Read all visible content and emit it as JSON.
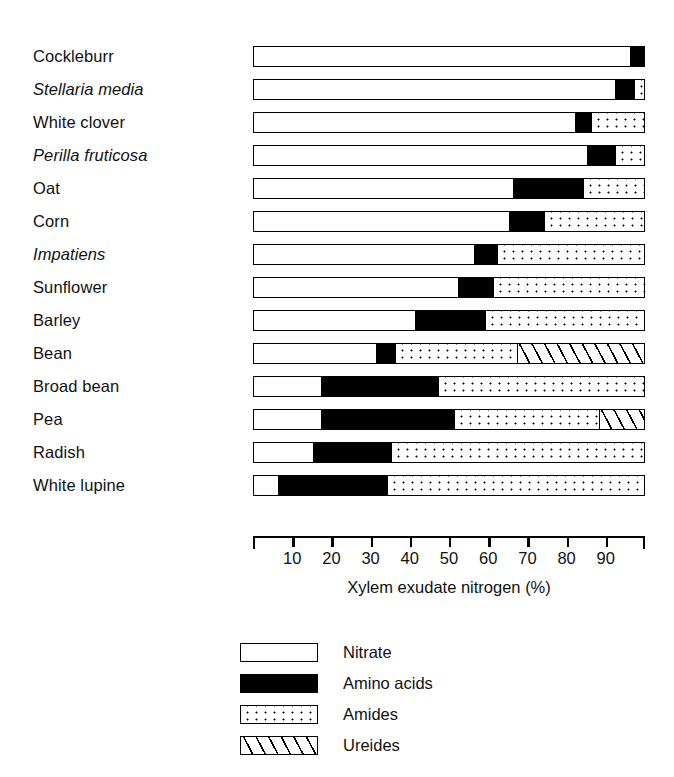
{
  "chart_data": {
    "type": "bar",
    "orientation": "horizontal",
    "stacked": true,
    "title": "",
    "xlabel": "Xylem exudate nitrogen (%)",
    "ylabel": "",
    "xlim": [
      0,
      100
    ],
    "xticks": [
      10,
      20,
      30,
      40,
      50,
      60,
      70,
      80,
      90
    ],
    "xtick_labels": [
      "10",
      "20",
      "30",
      "40",
      "50",
      "60",
      "70",
      "80",
      "90"
    ],
    "grid": false,
    "legend_position": "below-axis",
    "categories": [
      {
        "label": "Cockleburr",
        "italic": false
      },
      {
        "label": "Stellaria media",
        "italic": true
      },
      {
        "label": "White clover",
        "italic": false
      },
      {
        "label": "Perilla fruticosa",
        "italic": true
      },
      {
        "label": "Oat",
        "italic": false
      },
      {
        "label": "Corn",
        "italic": false
      },
      {
        "label": "Impatiens",
        "italic": true
      },
      {
        "label": "Sunflower",
        "italic": false
      },
      {
        "label": "Barley",
        "italic": false
      },
      {
        "label": "Bean",
        "italic": false
      },
      {
        "label": "Broad bean",
        "italic": false
      },
      {
        "label": "Pea",
        "italic": false
      },
      {
        "label": "Radish",
        "italic": false
      },
      {
        "label": "White lupine",
        "italic": false
      }
    ],
    "series": [
      {
        "name": "Nitrate",
        "fill": "white",
        "values": [
          96,
          92,
          82,
          85,
          66,
          65,
          56,
          52,
          41,
          31,
          17,
          17,
          15,
          6
        ]
      },
      {
        "name": "Amino acids",
        "fill": "black",
        "values": [
          4,
          5,
          4,
          7,
          18,
          9,
          6,
          9,
          18,
          5,
          30,
          34,
          20,
          28
        ]
      },
      {
        "name": "Amides",
        "fill": "dotted",
        "values": [
          0,
          3,
          14,
          8,
          16,
          26,
          38,
          39,
          41,
          31,
          53,
          37,
          65,
          66
        ]
      },
      {
        "name": "Ureides",
        "fill": "hatched",
        "values": [
          0,
          0,
          0,
          0,
          0,
          0,
          0,
          0,
          0,
          33,
          0,
          12,
          0,
          0
        ]
      }
    ],
    "legend": [
      {
        "label": "Nitrate",
        "fill": "white"
      },
      {
        "label": "Amino acids",
        "fill": "black"
      },
      {
        "label": "Amides",
        "fill": "dotted"
      },
      {
        "label": "Ureides",
        "fill": "hatched"
      }
    ]
  }
}
